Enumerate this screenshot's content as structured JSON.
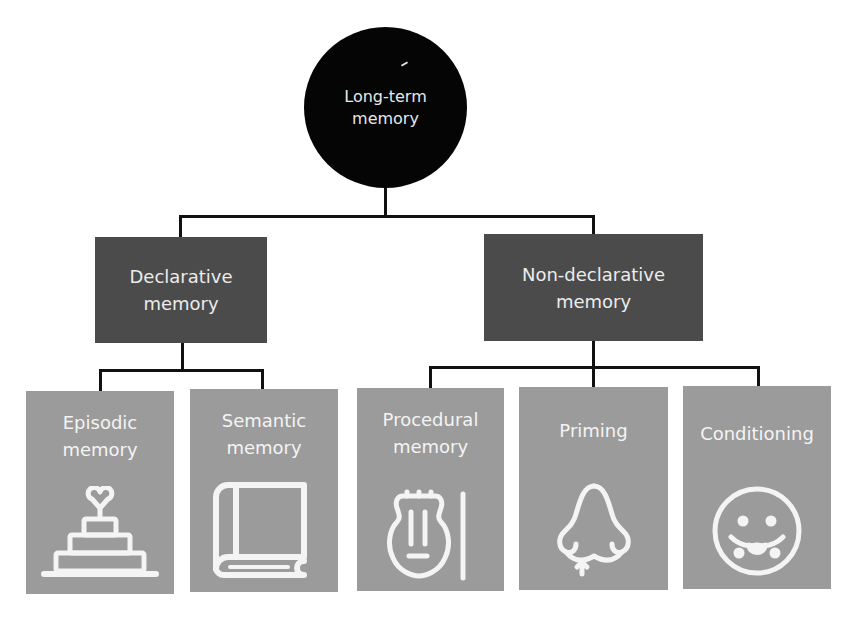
{
  "root": {
    "line1": "Long-term",
    "line2": "memory"
  },
  "categories": [
    {
      "line1": "Declarative",
      "line2": "memory"
    },
    {
      "line1": "Non-declarative",
      "line2": "memory"
    }
  ],
  "leaves": [
    {
      "line1": "Episodic",
      "line2": "memory",
      "icon": "wedding-cake-icon",
      "parent": "Declarative memory"
    },
    {
      "line1": "Semantic",
      "line2": "memory",
      "icon": "book-icon",
      "parent": "Declarative memory"
    },
    {
      "line1": "Procedural",
      "line2": "memory",
      "icon": "violin-icon",
      "parent": "Non-declarative memory"
    },
    {
      "line1": "Priming",
      "line2": "",
      "icon": "nose-icon",
      "parent": "Non-declarative memory"
    },
    {
      "line1": "Conditioning",
      "line2": "",
      "icon": "drooling-face-icon",
      "parent": "Non-declarative memory"
    }
  ],
  "colors": {
    "root_fill": "#050505",
    "category_fill": "#4b4b4b",
    "leaf_fill": "#9b9b9b",
    "connector": "#111111",
    "text": "#f4f4f4"
  }
}
